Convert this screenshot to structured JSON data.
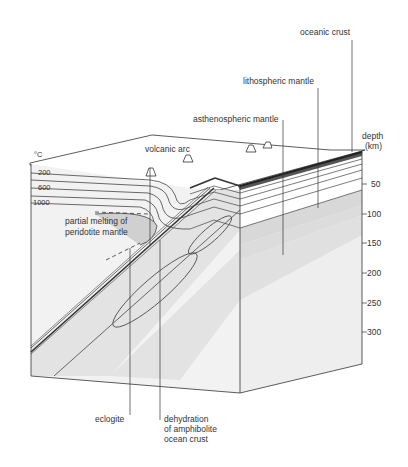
{
  "diagram": {
    "type": "block-diagram"
  },
  "labels": {
    "oceanic_crust": "oceanic crust",
    "lithospheric_mantle": "lithospheric mantle",
    "asthenospheric_mantle": "asthenospheric mantle",
    "volcanic_arc": "volcanic arc",
    "partial_melting_1": "partial melting of",
    "partial_melting_2": "peridotite mantle",
    "eclogite": "eclogite",
    "dehydration_1": "dehydration",
    "dehydration_2": "of amphibolite",
    "dehydration_3": "ocean crust"
  },
  "temperature": {
    "unit": "°C",
    "isotherms": [
      "200",
      "600",
      "1000"
    ]
  },
  "depth_axis": {
    "title_1": "depth",
    "title_2": "(km)",
    "ticks": [
      "50",
      "100",
      "150",
      "200",
      "250",
      "300"
    ]
  }
}
